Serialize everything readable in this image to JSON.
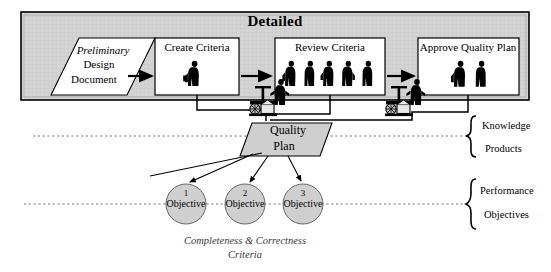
{
  "diagram": {
    "title": "Detailed",
    "phase_box": {
      "label": "Detailed",
      "fill": "#d0d0d0",
      "stroke": "#000000"
    },
    "input_document": {
      "line1": "Preliminary",
      "line2": "Design",
      "line3": "Document",
      "shape": "parallelogram",
      "fill": "#ffffff"
    },
    "process_steps": [
      {
        "label": "Create Criteria",
        "actors": 1,
        "shape": "rectangle",
        "fill": "#ffffff"
      },
      {
        "label": "Review Criteria",
        "actors": 5,
        "shape": "rectangle",
        "fill": "#ffffff"
      },
      {
        "label": "Approve Quality Plan",
        "actors": 2,
        "shape": "rectangle",
        "fill": "#ffffff"
      }
    ],
    "artifact": {
      "line1": "Quality",
      "line2": "Plan",
      "shape": "parallelogram",
      "fill": "#d0d0d0"
    },
    "objectives": [
      {
        "number": "1",
        "label": "Objective"
      },
      {
        "number": "2",
        "label": "Objective"
      },
      {
        "number": "3",
        "label": "Objective"
      }
    ],
    "caption": {
      "line1": "Completeness & Correctness",
      "line2": "Criteria"
    },
    "band_labels": [
      {
        "top": "Knowledge",
        "bottom": "Products"
      },
      {
        "top": "Performance",
        "bottom": "Objectives"
      }
    ],
    "machine_icons": [
      {
        "name": "press-machine-operator-left"
      },
      {
        "name": "press-machine-operator-right"
      }
    ],
    "divider_lines": [
      {
        "name": "knowledge-products-divider",
        "style": "dotted"
      },
      {
        "name": "performance-objectives-divider",
        "style": "dotted"
      }
    ]
  }
}
